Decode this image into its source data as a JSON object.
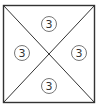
{
  "diagram": {
    "shape": "square divided by both diagonals into four triangles",
    "square": {
      "x": 3.5,
      "y": 5.5,
      "size": 91
    },
    "stroke_color": "#333333",
    "circle_stroke_color": "#777777",
    "triangles": [
      {
        "position": "top",
        "label": "3",
        "cx": 49,
        "cy": 24
      },
      {
        "position": "left",
        "label": "3",
        "cx": 22,
        "cy": 53
      },
      {
        "position": "right",
        "label": "3",
        "cx": 79,
        "cy": 53
      },
      {
        "position": "bottom",
        "label": "3",
        "cx": 49,
        "cy": 86
      }
    ]
  }
}
